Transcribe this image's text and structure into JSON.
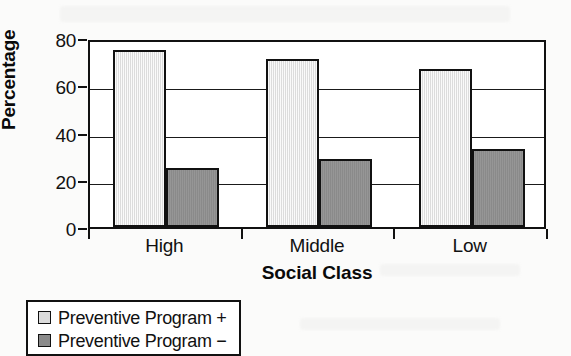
{
  "chart_data": {
    "type": "bar",
    "title": "",
    "xlabel": "Social Class",
    "ylabel": "Percentage",
    "categories": [
      "High",
      "Middle",
      "Low"
    ],
    "series": [
      {
        "name": "Preventive Program +",
        "color": "#dcdcdc",
        "values": [
          75,
          71,
          67
        ]
      },
      {
        "name": "Preventive Program −",
        "color": "#8a8a8a",
        "values": [
          25,
          29,
          33
        ]
      }
    ],
    "ylim": [
      0,
      80
    ],
    "yticks": [
      0,
      20,
      40,
      60,
      80
    ],
    "ytick_labels": [
      "0",
      "20",
      "40",
      "60",
      "80"
    ],
    "grid": true,
    "grid_axis": "y",
    "legend_position": "below-left",
    "frame": true,
    "colors": {
      "axis": "#111111",
      "gridline": "#1a1a1a",
      "plot_background": "#ffffff",
      "page_background": "#fbfbfa",
      "series_positive": "#dcdcdc",
      "series_negative": "#8a8a8a"
    }
  },
  "legend": {
    "items": [
      {
        "label": "Preventive Program +"
      },
      {
        "label": "Preventive Program −"
      }
    ]
  }
}
